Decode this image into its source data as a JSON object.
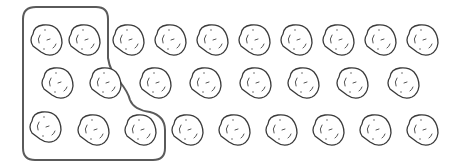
{
  "figure": {
    "object": "potato",
    "colors": {
      "stroke": "#3a3a3a",
      "group_outline": "#5a5a5a",
      "background": "#ffffff"
    },
    "rows": [
      {
        "row": 1,
        "count": 10,
        "grouped": 2
      },
      {
        "row": 2,
        "count": 8,
        "grouped": 2
      },
      {
        "row": 3,
        "count": 9,
        "grouped": 3
      }
    ],
    "total_count": 27,
    "grouped_count": 7,
    "ungrouped_count": 20
  }
}
